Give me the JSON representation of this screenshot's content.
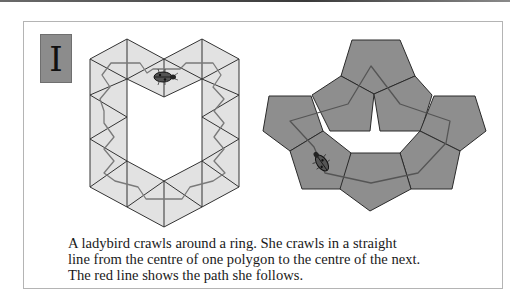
{
  "header": {
    "label": "I"
  },
  "figures": {
    "triangle_ring": {
      "shape": "triangle",
      "fill": "#e2e2e2",
      "stroke": "#333333",
      "path_color": "#7a7a7a"
    },
    "pentagon_ring": {
      "shape": "pentagon",
      "fill": "#8e8e8e",
      "stroke": "#2a2a2a",
      "path_color": "#555555"
    },
    "ladybird_icon": "ladybird-icon"
  },
  "caption": {
    "lines": [
      "A ladybird crawls around a ring. She crawls in a straight",
      "line from the centre of one polygon to the centre of the next.",
      "The red line shows the path she follows."
    ]
  }
}
